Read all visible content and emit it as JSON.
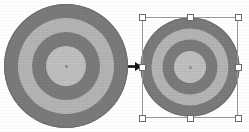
{
  "canvas": {
    "width": 249,
    "height": 132,
    "background": "#fefefe",
    "caption": ""
  },
  "palette": {
    "ring_dark": "#7d7d7d",
    "ring_light": "#b8b8b8",
    "ring_core_light": "#c3c3c3",
    "center_dot": "#8f8f8f",
    "outline": "#6f6f6f",
    "selection_line": "#9a9a9a",
    "handle_fill": "#ffffff",
    "handle_border": "#6b6b6b",
    "arrow_color": "#141414"
  },
  "objects": {
    "source_target": {
      "label": "Original target object",
      "center_x": 66,
      "center_y": 66,
      "diameter": 124,
      "rings": [
        {
          "name": "outer-dark-ring",
          "diameter": 124,
          "color": "#7d7d7d"
        },
        {
          "name": "light-ring",
          "diameter": 96,
          "color": "#b8b8b8"
        },
        {
          "name": "inner-dark-ring",
          "diameter": 68,
          "color": "#7d7d7d"
        },
        {
          "name": "core-light-disc",
          "diameter": 40,
          "color": "#c3c3c3"
        }
      ]
    },
    "scaled_target": {
      "label": "Scaled target object (selected)",
      "center_x": 190,
      "center_y": 67,
      "diameter": 99,
      "selected": true,
      "rings": [
        {
          "name": "outer-dark-ring",
          "diameter": 99,
          "color": "#7d7d7d"
        },
        {
          "name": "light-ring",
          "diameter": 77,
          "color": "#b8b8b8"
        },
        {
          "name": "inner-dark-ring",
          "diameter": 55,
          "color": "#7d7d7d"
        },
        {
          "name": "core-light-disc",
          "diameter": 32,
          "color": "#c3c3c3"
        }
      ]
    }
  },
  "selection": {
    "label": "Selection bounding box",
    "left": 142,
    "top": 17,
    "width": 96,
    "height": 101,
    "handle_size": 7,
    "handles": [
      {
        "name": "handle-top-left",
        "position": "nw",
        "x": 142,
        "y": 17,
        "cursor": "nwse-resize"
      },
      {
        "name": "handle-top-center",
        "position": "n",
        "x": 190,
        "y": 17,
        "cursor": "ns-resize"
      },
      {
        "name": "handle-top-right",
        "position": "ne",
        "x": 238,
        "y": 17,
        "cursor": "nesw-resize"
      },
      {
        "name": "handle-middle-left",
        "position": "w",
        "x": 142,
        "y": 67,
        "cursor": "ew-resize"
      },
      {
        "name": "handle-middle-right",
        "position": "e",
        "x": 238,
        "y": 67,
        "cursor": "ew-resize"
      },
      {
        "name": "handle-bottom-left",
        "position": "sw",
        "x": 142,
        "y": 118,
        "cursor": "nesw-resize"
      },
      {
        "name": "handle-bottom-center",
        "position": "s",
        "x": 190,
        "y": 118,
        "cursor": "ns-resize"
      },
      {
        "name": "handle-bottom-right",
        "position": "se",
        "x": 238,
        "y": 118,
        "cursor": "nwse-resize"
      }
    ]
  },
  "arrow": {
    "label": "transform-arrow",
    "direction": "right",
    "x": 128,
    "y": 62,
    "width": 14,
    "height": 9,
    "color": "#141414"
  }
}
